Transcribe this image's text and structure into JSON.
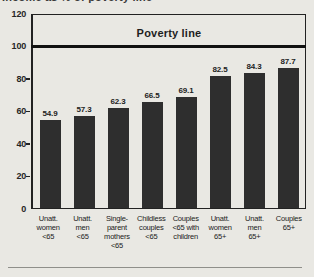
{
  "title_clipped": "Income as % of poverty line",
  "colors": {
    "background": "#e9e8e3",
    "bar": "#2e2e2e",
    "frame": "#222222",
    "poverty_line": "#111111",
    "text": "#262626",
    "bottom_rule": "#8f8f8a"
  },
  "chart_data": {
    "type": "bar",
    "title": "Income as % of poverty line",
    "categories": [
      "Unatt. women <65",
      "Unatt. men <65",
      "Single-parent mothers <65",
      "Childless couples <65",
      "Couples <65 with children",
      "Unatt. women 65+",
      "Unatt. men 65+",
      "Couples 65+"
    ],
    "category_lines": [
      [
        "Unatt.",
        "women",
        "<65"
      ],
      [
        "Unatt.",
        "men",
        "<65"
      ],
      [
        "Single-",
        "parent",
        "mothers",
        "<65"
      ],
      [
        "Childless",
        "couples",
        "<65"
      ],
      [
        "Couples",
        "<65 with",
        "children"
      ],
      [
        "Unatt.",
        "women",
        "65+"
      ],
      [
        "Unatt.",
        "men",
        "65+"
      ],
      [
        "Couples",
        "65+"
      ]
    ],
    "values": [
      54.9,
      57.3,
      62.3,
      66.5,
      69.1,
      82.5,
      84.3,
      87.7
    ],
    "value_labels": [
      "54.9",
      "57.3",
      "62.3",
      "66.5",
      "69.1",
      "82.5",
      "84.3",
      "87.7"
    ],
    "xlabel": "",
    "ylabel": "",
    "ylim": [
      0,
      120
    ],
    "yticks": [
      0,
      20,
      40,
      60,
      80,
      100,
      120
    ],
    "grid": false,
    "legend": null,
    "annotations": [
      {
        "label": "Poverty line",
        "y": 100,
        "style": "thick-horizontal-line"
      }
    ]
  }
}
